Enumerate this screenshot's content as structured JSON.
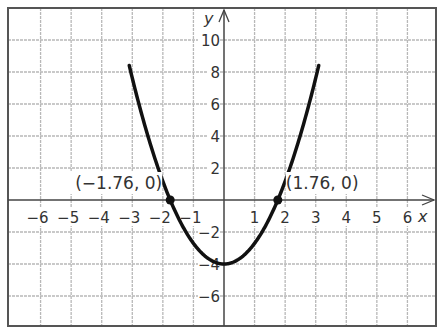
{
  "chart_data": {
    "type": "line",
    "title": "",
    "xlabel": "x",
    "ylabel": "y",
    "xlim": [
      -7,
      7
    ],
    "ylim": [
      -8,
      12
    ],
    "grid": true,
    "x_ticks": [
      -6,
      -5,
      -4,
      -3,
      -2,
      -1,
      1,
      2,
      3,
      4,
      5,
      6
    ],
    "y_ticks": [
      -6,
      -4,
      -2,
      2,
      4,
      6,
      8,
      10
    ],
    "x_tick_labels": [
      "−6",
      "−5",
      "−4",
      "−3",
      "−2",
      "−1",
      "1",
      "2",
      "3",
      "4",
      "5",
      "6"
    ],
    "y_tick_labels": [
      "−6",
      "−4",
      "−2",
      "2",
      "4",
      "6",
      "8",
      "10"
    ],
    "series": [
      {
        "name": "parabola",
        "equation_approx": "y = 1.29x^2 - 4",
        "x": [
          -3,
          -2.5,
          -2,
          -1.76,
          -1.5,
          -1,
          -0.5,
          0,
          0.5,
          1,
          1.5,
          1.76,
          2,
          2.5,
          3
        ],
        "values": [
          7.6,
          4.06,
          1.16,
          0,
          -1.1,
          -2.71,
          -3.68,
          -4,
          -3.68,
          -2.71,
          -1.1,
          0,
          1.16,
          4.06,
          7.6
        ]
      }
    ],
    "points": [
      {
        "x": -1.76,
        "y": 0,
        "label": "(−1.76, 0)"
      },
      {
        "x": 1.76,
        "y": 0,
        "label": "(1.76, 0)"
      }
    ],
    "colors": {
      "curve": "#111111",
      "grid": "#b8b8b8",
      "axis": "#444444",
      "frame": "#555555"
    }
  },
  "labels": {
    "x_axis": "x",
    "y_axis": "y",
    "left_point": "(−1.76, 0)",
    "right_point": "(1.76, 0)"
  }
}
